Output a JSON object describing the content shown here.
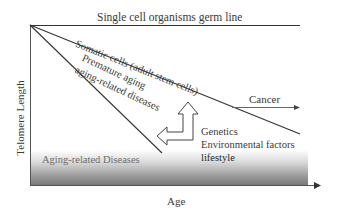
{
  "figure": {
    "axes": {
      "y_label": "Telomere Length",
      "x_label": "Age"
    },
    "lines": {
      "germ_line": "Single cell organisms germ line",
      "somatic": "Somatic cells (adult stem cells)",
      "premature_line1": "Premature aging",
      "premature_line2": "aging-related diseases",
      "cancer": "Cancer"
    },
    "factors": {
      "genetics": "Genetics",
      "environmental": "Environmental factors",
      "lifestyle": "lifestyle"
    },
    "region": {
      "diseases": "Aging-related Diseases"
    },
    "colors": {
      "line": "#333333",
      "gradient_dark": "#7a7a7a",
      "gradient_light": "#ffffff",
      "cancer_arrow": "#555555"
    }
  }
}
